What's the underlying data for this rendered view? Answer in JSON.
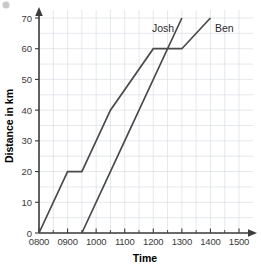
{
  "chart_data": {
    "type": "line",
    "title": "",
    "xlabel": "Time",
    "ylabel": "Distance in km",
    "grid": true,
    "legend_position": "inline-labels",
    "x_tick_labels": [
      "0800",
      "0900",
      "1000",
      "1100",
      "1200",
      "1300",
      "1400",
      "1500"
    ],
    "x_tick_values": [
      800,
      900,
      1000,
      1100,
      1200,
      1300,
      1400,
      1500
    ],
    "xlim": [
      800,
      1500
    ],
    "y_tick_labels": [
      "0",
      "10",
      "20",
      "30",
      "40",
      "50",
      "60",
      "70"
    ],
    "y_tick_values": [
      0,
      10,
      20,
      30,
      40,
      50,
      60,
      70
    ],
    "ylim": [
      0,
      72
    ],
    "series": [
      {
        "name": "Ben",
        "label": "Ben",
        "color": "#4a4a4a",
        "points": [
          {
            "x": 800,
            "y": 0
          },
          {
            "x": 900,
            "y": 20
          },
          {
            "x": 930,
            "y": 20
          },
          {
            "x": 1030,
            "y": 40
          },
          {
            "x": 1200,
            "y": 60
          },
          {
            "x": 1300,
            "y": 60
          },
          {
            "x": 1400,
            "y": 70
          }
        ]
      },
      {
        "name": "Josh",
        "label": "Josh",
        "color": "#4a4a4a",
        "points": [
          {
            "x": 930,
            "y": 0
          },
          {
            "x": 1100,
            "y": 30
          },
          {
            "x": 1300,
            "y": 70
          }
        ]
      }
    ]
  },
  "axes": {
    "x_title": "Time",
    "y_title": "Distance in km"
  },
  "labels": {
    "josh": "Josh",
    "ben": "Ben"
  }
}
